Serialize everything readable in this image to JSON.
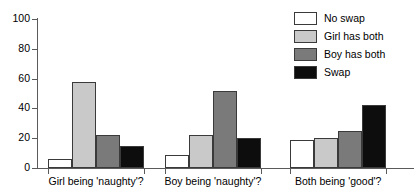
{
  "chart_data": {
    "type": "bar",
    "title": "",
    "subtitle": "",
    "xlabel": "",
    "ylabel": "",
    "ylim": [
      0,
      100
    ],
    "yticks": [
      0,
      20,
      40,
      60,
      80,
      100
    ],
    "ytick_labels": [
      "0",
      "20",
      "40",
      "60",
      "80",
      "100"
    ],
    "grid": false,
    "legend_position": "top-right",
    "categories": [
      "Girl being 'naughty'?",
      "Boy being 'naughty'?",
      "Both being 'good'?"
    ],
    "series": [
      {
        "name": "No swap",
        "color": "#ffffff",
        "values": [
          6,
          9,
          19
        ]
      },
      {
        "name": "Girl has both",
        "color": "#c9c9c9",
        "values": [
          58,
          22,
          20
        ]
      },
      {
        "name": "Boy has both",
        "color": "#7a7a7a",
        "values": [
          22,
          52,
          25
        ]
      },
      {
        "name": "Swap",
        "color": "#0d0d0d",
        "values": [
          15,
          20,
          42
        ]
      }
    ]
  },
  "axis": {
    "y": {
      "ticks": [
        {
          "value": 100,
          "label": "100"
        },
        {
          "value": 80,
          "label": "80"
        },
        {
          "value": 60,
          "label": "60"
        },
        {
          "value": 40,
          "label": "40"
        },
        {
          "value": 20,
          "label": "20"
        },
        {
          "value": 0,
          "label": "0"
        }
      ]
    },
    "x": {
      "labels": [
        "Girl being 'naughty'?",
        "Boy being 'naughty'?",
        "Both being 'good'?"
      ]
    }
  },
  "legend": {
    "items": [
      {
        "label": "No swap",
        "color": "#ffffff"
      },
      {
        "label": "Girl has both",
        "color": "#c9c9c9"
      },
      {
        "label": "Boy has both",
        "color": "#7a7a7a"
      },
      {
        "label": "Swap",
        "color": "#0d0d0d"
      }
    ]
  },
  "colors": {
    "axis": "#5a5a5a",
    "bar_outline": "#3a3a3a",
    "text": "#000000",
    "background": "#ffffff"
  }
}
